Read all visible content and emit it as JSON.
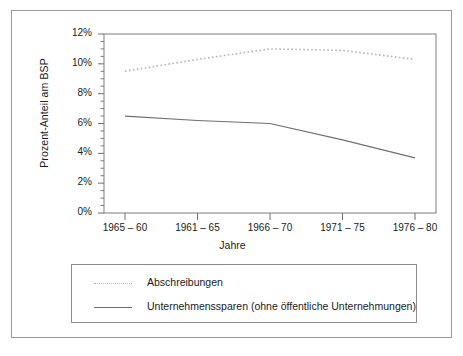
{
  "chart_data": {
    "type": "line",
    "title": "",
    "xlabel": "Jahre",
    "ylabel": "Prozent-Anteil am BSP",
    "categories": [
      "1965 – 60",
      "1961 – 65",
      "1966 – 70",
      "1971 – 75",
      "1976 – 80"
    ],
    "ylim": [
      0,
      12
    ],
    "yticks": [
      0,
      2,
      4,
      6,
      8,
      10,
      12
    ],
    "ytick_labels": [
      "0%",
      "2%",
      "4%",
      "6%",
      "8%",
      "10%",
      "12%"
    ],
    "yminor_step": 0.5,
    "grid": false,
    "legend_position": "below",
    "series": [
      {
        "name": "Abschreibungen",
        "style": "dotted",
        "color": "#b4b4b4",
        "values": [
          9.5,
          10.3,
          11.0,
          10.9,
          10.3
        ]
      },
      {
        "name": "Unternehmenssparen (ohne öffentliche Unternehmungen)",
        "style": "solid",
        "color": "#6f6f6f",
        "values": [
          6.5,
          6.2,
          6.0,
          4.9,
          3.7
        ]
      }
    ]
  },
  "legend": {
    "items": [
      {
        "label": "Abschreibungen",
        "swatch": "dotted-line-swatch"
      },
      {
        "label": "Unternehmenssparen (ohne öffentliche Unternehmungen)",
        "swatch": "solid-line-swatch"
      }
    ]
  },
  "axes": {
    "y_title": "Prozent-Anteil am BSP",
    "x_title": "Jahre",
    "y_tick_labels": [
      "12%",
      "10%",
      "8%",
      "6%",
      "4%",
      "2%",
      "0%"
    ],
    "x_tick_labels": [
      "1965 – 60",
      "1961 – 65",
      "1966 – 70",
      "1971 – 75",
      "1976 – 80"
    ]
  },
  "colors": {
    "frame": "#9a9a9a",
    "axis": "#6f6f6f",
    "series_dotted": "#b4b4b4",
    "series_solid": "#6f6f6f",
    "background": "#ffffff"
  }
}
